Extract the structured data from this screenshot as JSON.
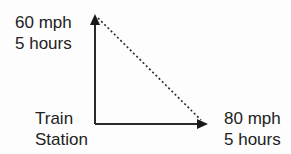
{
  "diagram": {
    "type": "right-triangle-vector",
    "north_label": {
      "line1": "60 mph",
      "line2": "5 hours"
    },
    "origin_label": {
      "line1": "Train",
      "line2": "Station"
    },
    "east_label": {
      "line1": "80 mph",
      "line2": "5 hours"
    },
    "colors": {
      "line": "#2a2a2a",
      "text": "#222222",
      "background": "#fdfdfd"
    },
    "edges": [
      {
        "from": "origin",
        "to": "north",
        "style": "solid-arrow"
      },
      {
        "from": "origin",
        "to": "east",
        "style": "solid-arrow"
      },
      {
        "from": "north",
        "to": "east",
        "style": "dotted"
      }
    ]
  }
}
